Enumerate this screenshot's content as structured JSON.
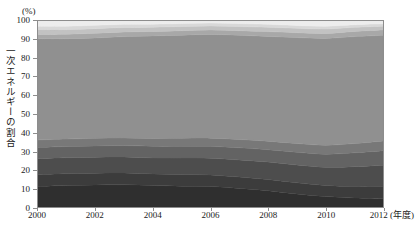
{
  "figure": {
    "unit_label": "(%)",
    "y_axis_title": "一次エネルギーの割合"
  },
  "chart_data": {
    "type": "area",
    "stacked": true,
    "title": "",
    "xlabel": "年度",
    "ylabel": "一次エネルギーの割合",
    "unit": "%",
    "ylim": [
      0,
      100
    ],
    "yticks": [
      0,
      10,
      20,
      30,
      40,
      50,
      60,
      70,
      80,
      90,
      100
    ],
    "xlim": [
      2000,
      2012
    ],
    "xticks": [
      2000,
      2002,
      2004,
      2006,
      2008,
      2010,
      2012
    ],
    "xtick_labels": [
      "2000",
      "2002",
      "2004",
      "2006",
      "2008",
      "2010",
      "2012"
    ],
    "x_axis_suffix": "(年度)",
    "grid": false,
    "legend": "none",
    "x": [
      2000,
      2001,
      2002,
      2003,
      2004,
      2005,
      2006,
      2007,
      2008,
      2009,
      2010,
      2011,
      2012
    ],
    "series": [
      {
        "name": "series-1",
        "color": "#2f2f2f",
        "values": [
          11.0,
          11.5,
          11.8,
          11.9,
          11.5,
          11.2,
          11.0,
          10.0,
          8.8,
          7.0,
          5.6,
          4.8,
          4.5
        ]
      },
      {
        "name": "series-2",
        "color": "#3c3c3c",
        "values": [
          6.5,
          6.4,
          6.4,
          6.4,
          6.3,
          6.3,
          6.2,
          6.1,
          6.0,
          6.0,
          6.0,
          6.3,
          6.6
        ]
      },
      {
        "name": "series-3",
        "color": "#4d4d4d",
        "values": [
          8.5,
          8.6,
          8.6,
          8.6,
          8.6,
          8.8,
          9.0,
          9.2,
          9.4,
          9.6,
          9.8,
          10.6,
          11.4
        ]
      },
      {
        "name": "series-4",
        "color": "#636363",
        "values": [
          6.0,
          6.0,
          6.0,
          6.1,
          6.2,
          6.3,
          6.4,
          6.5,
          6.6,
          6.8,
          7.0,
          7.4,
          7.8
        ]
      },
      {
        "name": "series-5",
        "color": "#787878",
        "values": [
          4.0,
          4.0,
          4.1,
          4.1,
          4.2,
          4.3,
          4.4,
          4.5,
          4.6,
          4.7,
          4.8,
          5.0,
          5.2
        ]
      },
      {
        "name": "series-6",
        "color": "#909090",
        "values": [
          54.5,
          54.0,
          54.0,
          54.5,
          55.2,
          55.5,
          55.8,
          56.0,
          56.3,
          57.0,
          57.4,
          57.5,
          56.8
        ]
      },
      {
        "name": "series-7",
        "color": "#a8a8a8",
        "values": [
          2.3,
          2.4,
          2.5,
          2.5,
          2.4,
          2.4,
          2.4,
          2.5,
          2.6,
          2.6,
          2.7,
          2.8,
          2.9
        ]
      },
      {
        "name": "series-8",
        "color": "#c2c2c2",
        "values": [
          2.6,
          2.5,
          2.5,
          2.4,
          2.3,
          2.2,
          2.1,
          2.2,
          2.3,
          2.4,
          2.4,
          2.2,
          2.0
        ]
      },
      {
        "name": "series-9",
        "color": "#d8d8d8",
        "values": [
          1.8,
          1.8,
          1.8,
          1.7,
          1.6,
          1.6,
          1.6,
          1.6,
          1.6,
          1.5,
          1.5,
          1.4,
          1.3
        ]
      },
      {
        "name": "series-10",
        "color": "#ededed",
        "values": [
          2.8,
          2.8,
          2.3,
          1.8,
          1.7,
          1.4,
          1.1,
          1.4,
          1.8,
          2.4,
          2.8,
          2.0,
          1.5
        ]
      }
    ]
  }
}
